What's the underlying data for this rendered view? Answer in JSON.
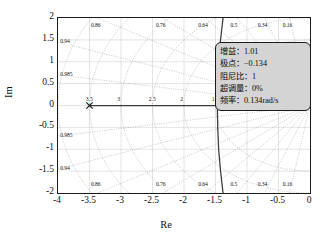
{
  "chart_data": {
    "type": "line",
    "title": "",
    "xlabel": "Re",
    "ylabel": "Im",
    "xlim": [
      -4,
      0
    ],
    "ylim": [
      -2,
      2
    ],
    "grid": true,
    "legend": "none",
    "xticks": [
      "-4",
      "-3.5",
      "-3",
      "-2.5",
      "-2",
      "-1.5",
      "-1",
      "-0.5",
      "0"
    ],
    "xtick_values": [
      -4,
      -3.5,
      -3,
      -2.5,
      -2,
      -1.5,
      -1,
      -0.5,
      0
    ],
    "yticks": [
      "2",
      "1.5",
      "1",
      "0.5",
      "0",
      "-0.5",
      "-1",
      "-1.5",
      "-2"
    ],
    "ytick_values": [
      2,
      1.5,
      1,
      0.5,
      0,
      -0.5,
      -1,
      -1.5,
      -2
    ],
    "damping_labels_top": [
      "0.86",
      "0.76",
      "0.64",
      "0.5",
      "0.34",
      "0.16"
    ],
    "damping_labels_bottom": [
      "0.86",
      "0.76",
      "0.64",
      "0.5",
      "0.34",
      "0.16"
    ],
    "damping_labels_left": [
      "0.94",
      "0.985"
    ],
    "damping_labels_left_lower": [
      "0.985",
      "0.94"
    ],
    "damping_values": [
      0.16,
      0.34,
      0.5,
      0.64,
      0.76,
      0.86,
      0.94,
      0.985
    ],
    "frequency_labels": [
      "4",
      "3.5",
      "3",
      "2.5",
      "2",
      "1.5"
    ],
    "frequency_values": [
      4,
      3.5,
      3,
      2.5,
      2,
      1.5
    ],
    "series": [
      {
        "name": "root-locus-branch-real-axis",
        "style": "solid",
        "color": "#3a3a3a",
        "points": [
          [
            -3.5,
            0
          ],
          [
            -0.134,
            0
          ]
        ]
      },
      {
        "name": "root-locus-branch-complex",
        "style": "solid",
        "color": "#3a3a3a",
        "points": [
          [
            -1.38,
            2.0
          ],
          [
            -1.42,
            1.5
          ],
          [
            -1.45,
            1.0
          ],
          [
            -1.465,
            0.5
          ],
          [
            -1.47,
            0
          ],
          [
            -1.465,
            -0.5
          ],
          [
            -1.45,
            -1.0
          ],
          [
            -1.42,
            -1.5
          ],
          [
            -1.38,
            -2.0
          ]
        ]
      }
    ],
    "markers": [
      {
        "name": "open-loop-pole-left",
        "x": -3.5,
        "y": 0,
        "symbol": "x"
      },
      {
        "name": "selected-pole",
        "x": -0.134,
        "y": 0,
        "symbol": "cross"
      }
    ]
  },
  "axes": {
    "x_title": "Re",
    "y_title": "Im"
  },
  "datatip": {
    "name": "data-tip",
    "rows": [
      {
        "label": "增益：",
        "value": "1.01",
        "text": "增益：1.01"
      },
      {
        "label": "极点：",
        "value": "−0.134",
        "text": "极点：−0.134"
      },
      {
        "label": "阻尼比：",
        "value": "1",
        "text": "阻尼比：1"
      },
      {
        "label": "超调量：",
        "value": "0%",
        "text": "超调量：0%"
      },
      {
        "label": "频率：",
        "value": "0.134rad/s",
        "text": "频率：0.134rad/s"
      }
    ],
    "background_color": "#d4d4d4",
    "border_color": "#1a1a1a"
  }
}
